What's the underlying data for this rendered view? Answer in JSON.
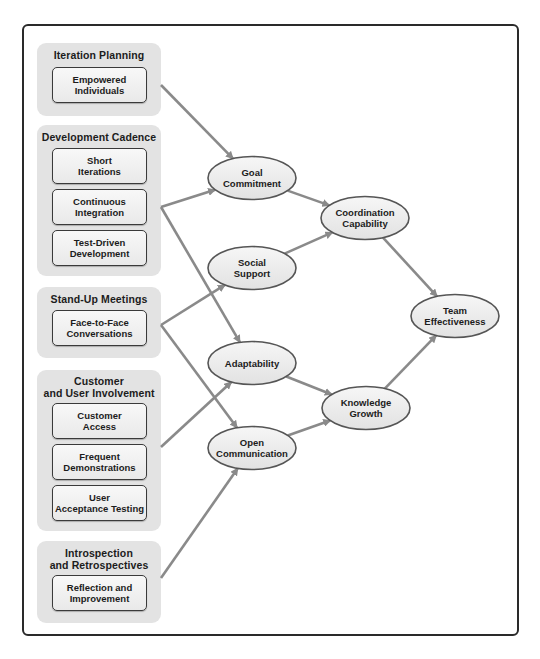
{
  "diagram": {
    "colors": {
      "frame": "#2a2a2a",
      "group_fill": "#e3e3e3",
      "box_fill": "#f2f2f2",
      "ellipse_fill": "#ececec",
      "ellipse_stroke": "#555555",
      "arrow": "#8a8a8a",
      "text": "#1c1c1c"
    },
    "groups": [
      {
        "title": "Iteration Planning",
        "practices": [
          {
            "id": "empowered",
            "label": "Empowered\nIndividuals"
          }
        ]
      },
      {
        "title": "Development Cadence",
        "practices": [
          {
            "id": "short-iterations",
            "label": "Short\nIterations"
          },
          {
            "id": "continuous-integration",
            "label": "Continuous\nIntegration"
          },
          {
            "id": "tdd",
            "label": "Test-Driven\nDevelopment"
          }
        ]
      },
      {
        "title": "Stand-Up Meetings",
        "practices": [
          {
            "id": "face-to-face",
            "label": "Face-to-Face\nConversations"
          }
        ]
      },
      {
        "title": "Customer\nand User Involvement",
        "practices": [
          {
            "id": "customer-access",
            "label": "Customer\nAccess"
          },
          {
            "id": "frequent-demos",
            "label": "Frequent\nDemonstrations"
          },
          {
            "id": "uat",
            "label": "User\nAcceptance Testing"
          }
        ]
      },
      {
        "title": "Introspection\nand Retrospectives",
        "practices": [
          {
            "id": "reflection",
            "label": "Reflection and\nImprovement"
          }
        ]
      }
    ],
    "nodes": [
      {
        "id": "goal-commitment",
        "label": [
          "Goal",
          "Commitment"
        ]
      },
      {
        "id": "social-support",
        "label": [
          "Social",
          "Support"
        ]
      },
      {
        "id": "adaptability",
        "label": [
          "Adaptability"
        ]
      },
      {
        "id": "open-communication",
        "label": [
          "Open",
          "Communication"
        ]
      },
      {
        "id": "coordination-capability",
        "label": [
          "Coordination",
          "Capability"
        ]
      },
      {
        "id": "knowledge-growth",
        "label": [
          "Knowledge",
          "Growth"
        ]
      },
      {
        "id": "team-effectiveness",
        "label": [
          "Team",
          "Effectiveness"
        ]
      }
    ],
    "edges": [
      {
        "from": "group:Iteration Planning",
        "to": "goal-commitment"
      },
      {
        "from": "group:Development Cadence",
        "to": "goal-commitment"
      },
      {
        "from": "group:Development Cadence",
        "to": "adaptability"
      },
      {
        "from": "group:Stand-Up Meetings",
        "to": "social-support"
      },
      {
        "from": "group:Stand-Up Meetings",
        "to": "open-communication"
      },
      {
        "from": "group:Customer and User Involvement",
        "to": "adaptability"
      },
      {
        "from": "group:Introspection and Retrospectives",
        "to": "open-communication"
      },
      {
        "from": "goal-commitment",
        "to": "coordination-capability"
      },
      {
        "from": "social-support",
        "to": "coordination-capability"
      },
      {
        "from": "adaptability",
        "to": "knowledge-growth"
      },
      {
        "from": "open-communication",
        "to": "knowledge-growth"
      },
      {
        "from": "coordination-capability",
        "to": "team-effectiveness"
      },
      {
        "from": "knowledge-growth",
        "to": "team-effectiveness"
      }
    ]
  }
}
